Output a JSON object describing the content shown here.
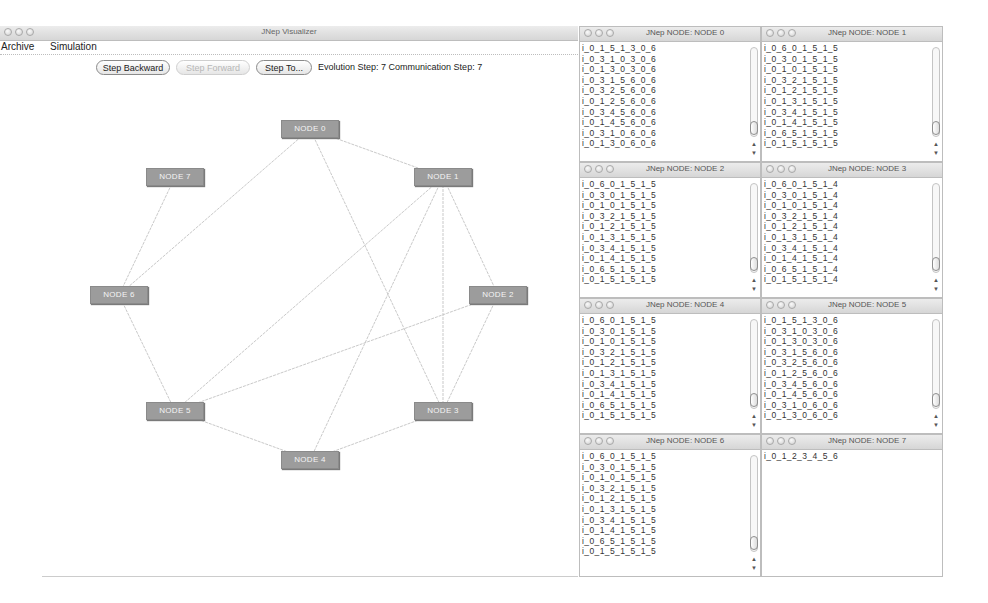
{
  "main_window": {
    "title": "JNep Visualizer",
    "menu": [
      {
        "label": "Archive"
      },
      {
        "label": "Simulation"
      }
    ],
    "toolbar": {
      "step_backward": "Step Backward",
      "step_forward": "Step Forward",
      "step_to": "Step To...",
      "evolution_label": "Evolution Step:",
      "evolution_value": "7",
      "communication_label": "Communication Step:",
      "communication_value": "7"
    },
    "graph": {
      "nodes": [
        {
          "id": 0,
          "label": "NODE 0",
          "x": 310,
          "y": 129
        },
        {
          "id": 1,
          "label": "NODE 1",
          "x": 443,
          "y": 177
        },
        {
          "id": 2,
          "label": "NODE 2",
          "x": 498,
          "y": 295
        },
        {
          "id": 3,
          "label": "NODE 3",
          "x": 443,
          "y": 411
        },
        {
          "id": 4,
          "label": "NODE 4",
          "x": 310,
          "y": 460
        },
        {
          "id": 5,
          "label": "NODE 5",
          "x": 175,
          "y": 411
        },
        {
          "id": 6,
          "label": "NODE 6",
          "x": 119,
          "y": 295
        },
        {
          "id": 7,
          "label": "NODE 7",
          "x": 175,
          "y": 177
        }
      ],
      "edges": [
        [
          0,
          1
        ],
        [
          0,
          6
        ],
        [
          0,
          3
        ],
        [
          7,
          6
        ],
        [
          1,
          5
        ],
        [
          1,
          4
        ],
        [
          1,
          3
        ],
        [
          1,
          2
        ],
        [
          2,
          5
        ],
        [
          2,
          3
        ],
        [
          6,
          5
        ],
        [
          5,
          4
        ],
        [
          4,
          3
        ]
      ],
      "edge_color": "#c9c9c9",
      "node_color": "#9c9c9c"
    }
  },
  "node_windows": [
    {
      "title": "JNep NODE: NODE 0",
      "lines": [
        "i_0_1_5_1_3_0_6",
        "i_0_3_1_0_3_0_6",
        "i_0_1_3_0_3_0_6",
        "i_0_3_1_5_6_0_6",
        "i_0_3_2_5_6_0_6",
        "i_0_1_2_5_6_0_6",
        "i_0_3_4_5_6_0_6",
        "i_0_1_4_5_6_0_6",
        "i_0_3_1_0_6_0_6",
        "i_0_1_3_0_6_0_6"
      ]
    },
    {
      "title": "JNep NODE: NODE 1",
      "lines": [
        "i_0_6_0_1_5_1_5",
        "i_0_3_0_1_5_1_5",
        "i_0_1_0_1_5_1_5",
        "i_0_3_2_1_5_1_5",
        "i_0_1_2_1_5_1_5",
        "i_0_1_3_1_5_1_5",
        "i_0_3_4_1_5_1_5",
        "i_0_1_4_1_5_1_5",
        "i_0_6_5_1_5_1_5",
        "i_0_1_5_1_5_1_5"
      ]
    },
    {
      "title": "JNep NODE: NODE 2",
      "lines": [
        "i_0_6_0_1_5_1_5",
        "i_0_3_0_1_5_1_5",
        "i_0_1_0_1_5_1_5",
        "i_0_3_2_1_5_1_5",
        "i_0_1_2_1_5_1_5",
        "i_0_1_3_1_5_1_5",
        "i_0_3_4_1_5_1_5",
        "i_0_1_4_1_5_1_5",
        "i_0_6_5_1_5_1_5",
        "i_0_1_5_1_5_1_5"
      ]
    },
    {
      "title": "JNep NODE: NODE 3",
      "lines": [
        "i_0_6_0_1_5_1_4",
        "i_0_3_0_1_5_1_4",
        "i_0_1_0_1_5_1_4",
        "i_0_3_2_1_5_1_4",
        "i_0_1_2_1_5_1_4",
        "i_0_1_3_1_5_1_4",
        "i_0_3_4_1_5_1_4",
        "i_0_1_4_1_5_1_4",
        "i_0_6_5_1_5_1_4",
        "i_0_1_5_1_5_1_4"
      ]
    },
    {
      "title": "JNep NODE: NODE 4",
      "lines": [
        "i_0_6_0_1_5_1_5",
        "i_0_3_0_1_5_1_5",
        "i_0_1_0_1_5_1_5",
        "i_0_3_2_1_5_1_5",
        "i_0_1_2_1_5_1_5",
        "i_0_1_3_1_5_1_5",
        "i_0_3_4_1_5_1_5",
        "i_0_1_4_1_5_1_5",
        "i_0_6_5_1_5_1_5",
        "i_0_1_5_1_5_1_5"
      ]
    },
    {
      "title": "JNep NODE: NODE 5",
      "lines": [
        "i_0_1_5_1_3_0_6",
        "i_0_3_1_0_3_0_6",
        "i_0_1_3_0_3_0_6",
        "i_0_3_1_5_6_0_6",
        "i_0_3_2_5_6_0_6",
        "i_0_1_2_5_6_0_6",
        "i_0_3_4_5_6_0_6",
        "i_0_1_4_5_6_0_6",
        "i_0_3_1_0_6_0_6",
        "i_0_1_3_0_6_0_6"
      ]
    },
    {
      "title": "JNep NODE: NODE 6",
      "lines": [
        "i_0_6_0_1_5_1_5",
        "i_0_3_0_1_5_1_5",
        "i_0_1_0_1_5_1_5",
        "i_0_3_2_1_5_1_5",
        "i_0_1_2_1_5_1_5",
        "i_0_1_3_1_5_1_5",
        "i_0_3_4_1_5_1_5",
        "i_0_1_4_1_5_1_5",
        "i_0_6_5_1_5_1_5",
        "i_0_1_5_1_5_1_5"
      ]
    },
    {
      "title": "JNep NODE: NODE 7",
      "lines": [
        "i_0_1_2_3_4_5_6"
      ]
    }
  ]
}
